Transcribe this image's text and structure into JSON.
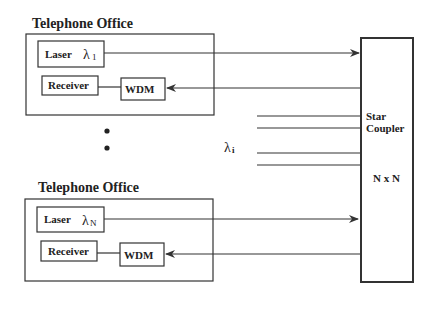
{
  "diagram": {
    "offices": [
      {
        "title": "Telephone  Office",
        "laser_label": "Laser",
        "wavelength_symbol": "λ",
        "wavelength_subscript": "1",
        "receiver_label": "Receiver",
        "wdm_label": "WDM"
      },
      {
        "title": "Telephone  Office",
        "laser_label": "Laser",
        "wavelength_symbol": "λ",
        "wavelength_subscript": "N",
        "receiver_label": "Receiver",
        "wdm_label": "WDM"
      }
    ],
    "middle_wavelength": {
      "symbol": "λ",
      "subscript": "i"
    },
    "coupler": {
      "line1": "Star",
      "line2": "Coupler",
      "size_label": "N x N"
    },
    "ellipsis_dots": 2,
    "colors": {
      "stroke": "#333333",
      "text": "#222222",
      "background": "#ffffff"
    }
  }
}
